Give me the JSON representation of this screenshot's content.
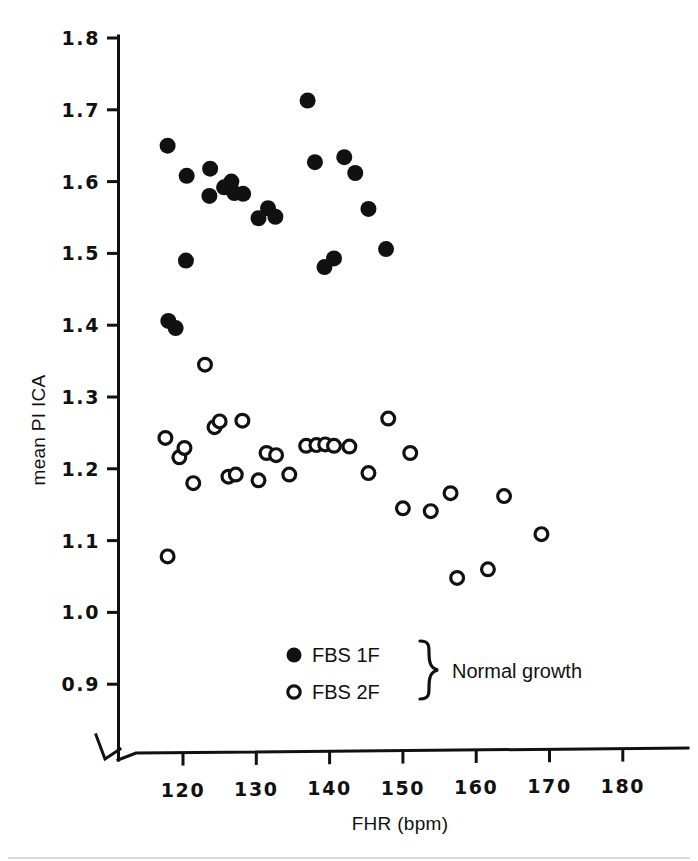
{
  "chart_data": {
    "type": "scatter",
    "title": "",
    "xlabel": "FHR (bpm)",
    "ylabel": "mean PI ICA",
    "xlim": [
      113,
      186
    ],
    "ylim": [
      0.88,
      1.81
    ],
    "xticks": [
      120,
      130,
      140,
      150,
      160,
      170,
      180
    ],
    "xtick_labels": [
      "120",
      "130",
      "140",
      "150",
      "160",
      "170",
      "180"
    ],
    "yticks": [
      0.9,
      1.0,
      1.1,
      1.2,
      1.3,
      1.4,
      1.5,
      1.6,
      1.7,
      1.8
    ],
    "ytick_labels": [
      "0.9",
      "1.0",
      "1.1",
      "1.2",
      "1.3",
      "1.4",
      "1.5",
      "1.6",
      "1.7",
      "1.8"
    ],
    "grid": false,
    "axis_break": true,
    "legend_position": "inside-bottom-center",
    "legend_group_label": "Normal growth",
    "series": [
      {
        "name": "FBS 1F",
        "marker": "filled-circle",
        "color": "#111111",
        "points": [
          [
            117.9,
            1.65
          ],
          [
            118.0,
            1.406
          ],
          [
            119.0,
            1.396
          ],
          [
            120.4,
            1.49
          ],
          [
            120.5,
            1.608
          ],
          [
            123.6,
            1.58
          ],
          [
            123.7,
            1.618
          ],
          [
            125.6,
            1.592
          ],
          [
            126.6,
            1.6
          ],
          [
            127.0,
            1.584
          ],
          [
            128.2,
            1.583
          ],
          [
            130.3,
            1.549
          ],
          [
            131.6,
            1.563
          ],
          [
            132.6,
            1.551
          ],
          [
            137.0,
            1.713
          ],
          [
            138.0,
            1.627
          ],
          [
            139.3,
            1.481
          ],
          [
            140.6,
            1.493
          ],
          [
            142.0,
            1.634
          ],
          [
            143.5,
            1.612
          ],
          [
            145.3,
            1.562
          ],
          [
            147.7,
            1.506
          ]
        ]
      },
      {
        "name": "FBS 2F",
        "marker": "open-circle",
        "color": "#111111",
        "points": [
          [
            117.6,
            1.243
          ],
          [
            117.9,
            1.078
          ],
          [
            119.5,
            1.216
          ],
          [
            120.2,
            1.229
          ],
          [
            121.4,
            1.18
          ],
          [
            123.0,
            1.345
          ],
          [
            124.3,
            1.258
          ],
          [
            125.0,
            1.266
          ],
          [
            126.2,
            1.189
          ],
          [
            127.2,
            1.192
          ],
          [
            128.1,
            1.267
          ],
          [
            130.3,
            1.184
          ],
          [
            131.4,
            1.222
          ],
          [
            132.7,
            1.219
          ],
          [
            134.5,
            1.192
          ],
          [
            136.8,
            1.232
          ],
          [
            138.2,
            1.233
          ],
          [
            139.4,
            1.234
          ],
          [
            140.6,
            1.232
          ],
          [
            142.7,
            1.231
          ],
          [
            145.3,
            1.194
          ],
          [
            148.0,
            1.27
          ],
          [
            150.0,
            1.145
          ],
          [
            151.0,
            1.222
          ],
          [
            153.8,
            1.141
          ],
          [
            156.5,
            1.166
          ],
          [
            157.4,
            1.048
          ],
          [
            161.6,
            1.06
          ],
          [
            163.8,
            1.162
          ],
          [
            168.9,
            1.109
          ]
        ]
      }
    ]
  },
  "legend": {
    "entries": [
      {
        "marker": "filled-circle",
        "label": "FBS 1F"
      },
      {
        "marker": "open-circle",
        "label": "FBS 2F"
      }
    ],
    "group_label": "Normal growth"
  },
  "axes": {
    "x_title": "FHR (bpm)",
    "y_title": "mean PI ICA"
  },
  "style": {
    "ink_color": "#111111",
    "paper_color": "#ffffff"
  }
}
